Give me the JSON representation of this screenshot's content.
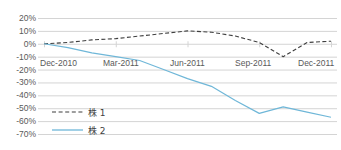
{
  "chart_data": {
    "type": "line",
    "title": "",
    "xlabel": "",
    "ylabel": "",
    "ylim": [
      -70,
      20
    ],
    "ytick_labels": [
      "20%",
      "10%",
      "0%",
      "-10%",
      "-20%",
      "-30%",
      "-40%",
      "-50%",
      "-60%",
      "-70%"
    ],
    "ytick_values": [
      20,
      10,
      0,
      -10,
      -20,
      -30,
      -40,
      -50,
      -60,
      -70
    ],
    "xtick_labels": [
      "Dec-2010",
      "Mar-2011",
      "Jun-2011",
      "Sep-2011",
      "Dec-2011"
    ],
    "grid": true,
    "legend_position": "lower-left-inside",
    "x_range": [
      "Dec-2010",
      "Dec-2011"
    ],
    "series": [
      {
        "name": "株 1",
        "style": "dashed",
        "color": "#3f3f3f",
        "x": [
          "Dec-2010",
          "Jan-2011",
          "Feb-2011",
          "Mar-2011",
          "Apr-2011",
          "May-2011",
          "Jun-2011",
          "Jul-2011",
          "Aug-2011",
          "Sep-2011",
          "Oct-2011",
          "Nov-2011",
          "Dec-2011"
        ],
        "values": [
          0,
          1,
          3,
          4,
          6,
          8,
          10,
          9,
          6,
          1,
          -10,
          1,
          2
        ]
      },
      {
        "name": "株 2",
        "style": "solid",
        "color": "#6fb7d8",
        "x": [
          "Dec-2010",
          "Jan-2011",
          "Feb-2011",
          "Mar-2011",
          "Apr-2011",
          "May-2011",
          "Jun-2011",
          "Jul-2011",
          "Aug-2011",
          "Sep-2011",
          "Oct-2011",
          "Nov-2011",
          "Dec-2011"
        ],
        "values": [
          0,
          -3,
          -7,
          -10,
          -13,
          -20,
          -27,
          -33,
          -44,
          -54,
          -49,
          -53,
          -57
        ]
      }
    ],
    "colors": {
      "series1": "#3f3f3f",
      "series2": "#6fb7d8",
      "grid": "#d4d4d4",
      "text": "#595959"
    }
  },
  "axis": {
    "y_ticks": [
      {
        "label": "20%",
        "value": 20
      },
      {
        "label": "10%",
        "value": 10
      },
      {
        "label": "0%",
        "value": 0
      },
      {
        "label": "-10%",
        "value": -10
      },
      {
        "label": "-20%",
        "value": -20
      },
      {
        "label": "-30%",
        "value": -30
      },
      {
        "label": "-40%",
        "value": -40
      },
      {
        "label": "-50%",
        "value": -50
      },
      {
        "label": "-60%",
        "value": -60
      },
      {
        "label": "-70%",
        "value": -70
      }
    ],
    "x_ticks": [
      {
        "label": "Dec-2010"
      },
      {
        "label": "Mar-2011"
      },
      {
        "label": "Jun-2011"
      },
      {
        "label": "Sep-2011"
      },
      {
        "label": "Dec-2011"
      }
    ]
  },
  "legend": {
    "items": [
      {
        "label": "株 1",
        "style": "dashed",
        "color": "#3f3f3f"
      },
      {
        "label": "株 2",
        "style": "solid",
        "color": "#6fb7d8"
      }
    ]
  }
}
